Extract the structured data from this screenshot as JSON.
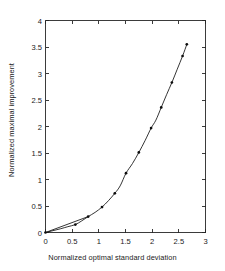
{
  "chart_data": {
    "type": "line",
    "title": "",
    "xlabel": "Normalized optimal standard deviation",
    "ylabel": "Normalized maximal improvement",
    "xlim": [
      0,
      3
    ],
    "ylim": [
      0,
      4
    ],
    "xticks": [
      0,
      0.5,
      1,
      1.5,
      2,
      2.5,
      3
    ],
    "yticks": [
      0,
      0.5,
      1,
      1.5,
      2,
      2.5,
      3,
      3.5,
      4
    ],
    "xticklabels": [
      "0",
      "0.5",
      "1",
      "1.5",
      "2",
      "2.5",
      "3"
    ],
    "yticklabels": [
      "0",
      "0.5",
      "1",
      "1.5",
      "2",
      "2.5",
      "3",
      "3.5",
      "4"
    ],
    "grid": false,
    "legend": null,
    "box": true,
    "tick_direction": "in",
    "series": [
      {
        "name": "normalized maximal improvement curve",
        "marker": "dot",
        "line": "solid",
        "color": "#101010",
        "x": [
          0.0,
          0.12,
          0.28,
          0.42,
          0.56,
          0.68,
          0.8,
          0.93,
          1.06,
          1.18,
          1.3,
          1.4,
          1.51,
          1.63,
          1.75,
          1.87,
          1.98,
          2.07,
          2.17,
          2.27,
          2.37,
          2.47,
          2.57,
          2.65
        ],
        "y": [
          0.0,
          0.03,
          0.07,
          0.11,
          0.15,
          0.22,
          0.3,
          0.38,
          0.48,
          0.6,
          0.74,
          0.88,
          1.12,
          1.3,
          1.51,
          1.74,
          1.97,
          2.12,
          2.36,
          2.6,
          2.83,
          3.08,
          3.33,
          3.55
        ]
      },
      {
        "name": "straight chord from origin",
        "marker": "none",
        "line": "solid",
        "color": "#101010",
        "x": [
          0.0,
          0.8
        ],
        "y": [
          0.0,
          0.3
        ]
      }
    ],
    "markers_x": [
      0.0,
      0.56,
      0.8,
      1.06,
      1.3,
      1.51,
      1.75,
      1.98,
      2.17,
      2.37,
      2.57,
      2.65
    ],
    "markers_y": [
      0.0,
      0.15,
      0.3,
      0.48,
      0.74,
      1.12,
      1.51,
      1.97,
      2.36,
      2.83,
      3.33,
      3.55
    ]
  },
  "axes": {
    "xlabel": "Normalized optimal standard deviation",
    "ylabel": "Normalized maximal improvement"
  },
  "colors": {
    "background": "#ffffff",
    "axis": "#262626",
    "curve": "#101010",
    "text": "#1b1b1b"
  }
}
